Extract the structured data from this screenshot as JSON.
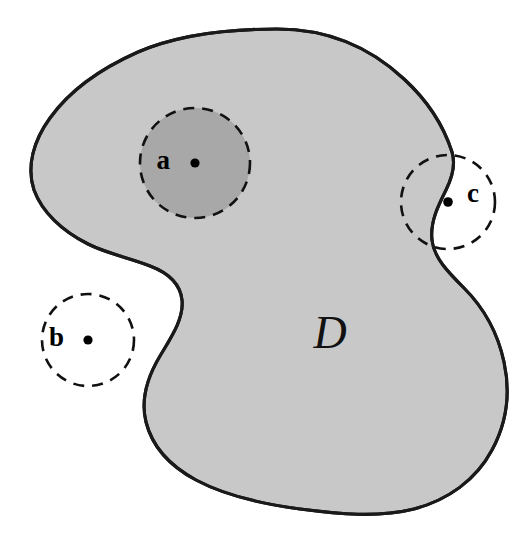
{
  "figure": {
    "region_label": "D",
    "background_color": "#ffffff",
    "region_fill_color": "#c8c8c8",
    "region_border_color": "#1a1a1a",
    "neighborhood_fill_color": "#a8a8a8",
    "dash_color": "#111111"
  },
  "points": [
    {
      "label": "a",
      "kind": "interior-point",
      "x": 195,
      "y": 163,
      "label_x": 170,
      "label_y": 163,
      "neighborhood_radius": 55,
      "neighborhood_shaded": true
    },
    {
      "label": "b",
      "kind": "exterior-point",
      "x": 88,
      "y": 340,
      "label_x": 64,
      "label_y": 340,
      "neighborhood_radius": 46,
      "neighborhood_shaded": false
    },
    {
      "label": "c",
      "kind": "boundary-point",
      "x": 448,
      "y": 202,
      "label_x": 467,
      "label_y": 196,
      "neighborhood_radius": 47,
      "neighborhood_shaded": false
    }
  ],
  "region_label_position": {
    "x": 330,
    "y": 337
  },
  "region_outline_path": "M 277 29 C 330 29 372 49 404 79 C 428 101 444 127 452 152 C 456 165 452 178 446 190 C 438 206 430 222 432 240 C 434 258 448 272 464 288 C 484 308 498 334 504 362 C 511 394 506 424 492 450 C 476 480 448 500 414 509 C 378 518 338 514 300 509 C 262 504 226 496 196 480 C 170 466 152 446 146 422 C 140 398 148 376 160 356 C 172 336 184 318 182 300 C 180 282 166 272 150 266 C 130 258 108 254 88 244 C 62 231 42 212 34 190 C 26 166 34 140 50 118 C 70 90 102 68 138 52 C 180 34 230 29 277 29 Z"
}
